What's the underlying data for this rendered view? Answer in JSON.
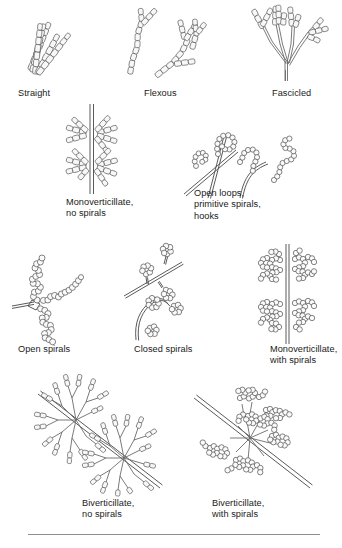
{
  "figure": {
    "background_color": "#ffffff",
    "ink_color": "#4a4a4a",
    "text_color": "#1a1a1a",
    "rule_color": "#8e8e8e",
    "rows": [
      {
        "row_index": 1,
        "items": [
          {
            "id": "straight",
            "label": "Straight",
            "icon": "straight-conidial-chains-icon"
          },
          {
            "id": "flexous",
            "label": "Flexous",
            "icon": "flexous-conidial-chains-icon"
          },
          {
            "id": "fascicled",
            "label": "Fascicled",
            "icon": "fascicled-conidiophore-icon"
          }
        ]
      },
      {
        "row_index": 2,
        "items": [
          {
            "id": "monoverticillate-no-spirals",
            "label": "Monoverticillate,\nno spirals",
            "icon": "monoverticillate-no-spirals-icon"
          },
          {
            "id": "open-loops",
            "label": "Open loops,\nprimitive spirals,\nhooks",
            "icon": "open-loops-hooks-icon"
          }
        ]
      },
      {
        "row_index": 3,
        "items": [
          {
            "id": "open-spirals",
            "label": "Open spirals",
            "icon": "open-spirals-icon"
          },
          {
            "id": "closed-spirals",
            "label": "Closed spirals",
            "icon": "closed-spirals-icon"
          },
          {
            "id": "monoverticillate-with-spirals",
            "label": "Monoverticillate,\nwith spirals",
            "icon": "monoverticillate-with-spirals-icon"
          }
        ]
      },
      {
        "row_index": 4,
        "items": [
          {
            "id": "biverticillate-no-spirals",
            "label": "Biverticillate,\nno spirals",
            "icon": "biverticillate-no-spirals-icon"
          },
          {
            "id": "biverticillate-with-spirals",
            "label": "Biverticillate,\nwith spirals",
            "icon": "biverticillate-with-spirals-icon"
          }
        ]
      }
    ]
  }
}
